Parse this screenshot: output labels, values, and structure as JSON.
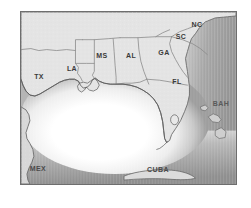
{
  "figure": {
    "kind": "reference-map",
    "region": "Gulf of Mexico and Southeastern United States",
    "frame": {
      "border_color": "#6e6e6e",
      "background_color": "#ffffff"
    }
  },
  "map": {
    "land_color": "#e4e4e4",
    "land_outline_color": "#6b6b6b",
    "state_border_color": "#8a8a8a",
    "shelf_color": "#ffffff",
    "deep_ocean_color": "#9a9a9a",
    "labels": [
      {
        "id": "tx",
        "text": "TX",
        "type": "state",
        "x": 18,
        "y": 64
      },
      {
        "id": "la",
        "text": "LA",
        "type": "state",
        "x": 51,
        "y": 56
      },
      {
        "id": "ms",
        "text": "MS",
        "type": "state",
        "x": 81,
        "y": 43
      },
      {
        "id": "al",
        "text": "AL",
        "type": "state",
        "x": 110,
        "y": 43
      },
      {
        "id": "ga",
        "text": "GA",
        "type": "state",
        "x": 143,
        "y": 40
      },
      {
        "id": "sc",
        "text": "SC",
        "type": "state",
        "x": 160,
        "y": 24
      },
      {
        "id": "nc",
        "text": "NC",
        "type": "state",
        "x": 176,
        "y": 12
      },
      {
        "id": "fl",
        "text": "FL",
        "type": "state",
        "x": 156,
        "y": 69
      },
      {
        "id": "mex",
        "text": "MEX",
        "type": "country",
        "x": 17,
        "y": 156
      },
      {
        "id": "cuba",
        "text": "CUBA",
        "type": "country",
        "x": 137,
        "y": 157
      },
      {
        "id": "bah",
        "text": "BAH",
        "type": "country",
        "x": 200,
        "y": 91
      }
    ]
  }
}
